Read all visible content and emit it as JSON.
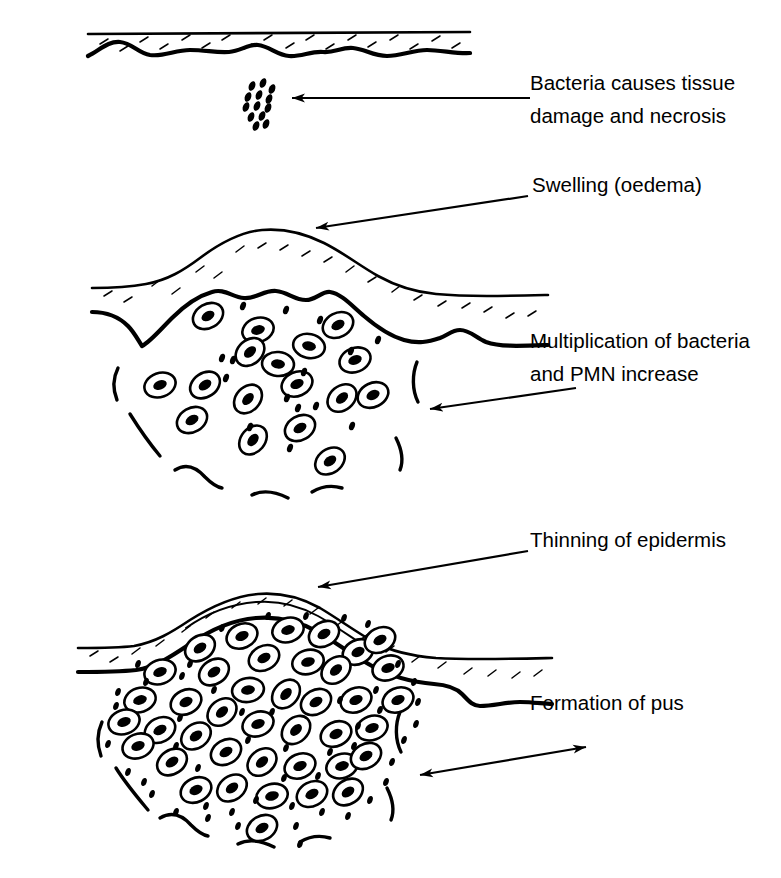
{
  "figure": {
    "background_color": "#ffffff",
    "ink_color": "#000000",
    "width": 781,
    "height": 878
  },
  "labels": [
    {
      "id": "bacteria-damage",
      "lines": [
        "Bacteria causes tissue",
        "damage and necrosis"
      ],
      "x": 530,
      "y": 90,
      "arrow": {
        "type": "single",
        "from_x": 530,
        "from_y": 98,
        "to_x": 286,
        "to_y": 98
      }
    },
    {
      "id": "swelling",
      "lines": [
        "Swelling (oedema)"
      ],
      "x": 532,
      "y": 192,
      "arrow": {
        "type": "single",
        "from_x": 528,
        "from_y": 196,
        "to_x": 310,
        "to_y": 229
      }
    },
    {
      "id": "multiplication",
      "lines": [
        "Multiplication of bacteria",
        "and PMN increase"
      ],
      "x": 530,
      "y": 348,
      "arrow": {
        "type": "single",
        "from_x": 575,
        "from_y": 389,
        "to_x": 424,
        "to_y": 410
      }
    },
    {
      "id": "thinning",
      "lines": [
        "Thinning of epidermis"
      ],
      "x": 530,
      "y": 547,
      "arrow": {
        "type": "single",
        "from_x": 528,
        "from_y": 551,
        "to_x": 312,
        "to_y": 588
      }
    },
    {
      "id": "formation-of-pus",
      "lines": [
        "Formation of pus"
      ],
      "x": 530,
      "y": 710,
      "arrow": {
        "type": "double",
        "from_x": 586,
        "from_y": 747,
        "to_x": 414,
        "to_y": 776
      }
    }
  ],
  "panels": [
    {
      "id": "panel-normal-skin",
      "stage": 1,
      "caption_ref": "bacteria-damage",
      "description": "Flat intact skin with epidermis band; a small cluster of bacteria below the dermis",
      "cell_count": 0,
      "bacteria_count": 13
    },
    {
      "id": "panel-early-abscess",
      "stage": 2,
      "caption_ref": [
        "swelling",
        "multiplication"
      ],
      "description": "Raised dome of epidermis over a loose collection of PMN cells and bacteria in the dermis",
      "cell_count": 17,
      "bacteria_count": 15
    },
    {
      "id": "panel-mature-abscess",
      "stage": 3,
      "caption_ref": [
        "thinning",
        "formation-of-pus"
      ],
      "description": "Epidermis thinned and stretched over a dense mass of PMN cells forming pus",
      "cell_count": 42,
      "bacteria_count": 70
    }
  ],
  "legend_keys": {
    "cell": "PMN (polymorphonuclear leucocyte)",
    "dot": "bacterium",
    "band": "epidermis",
    "wavy_line": "dermis boundary"
  },
  "geometry": {
    "panel1": {
      "epidermis_top": "M 88,34 L 470,31",
      "epidermis_bottom": "M 88,55 C 103,47 110,40 122,42 C 134,44 140,54 152,55 C 166,56 176,50 190,50 C 206,50 215,52 228,51 C 240,50 248,44 258,45 C 268,46 276,54 288,55 C 300,56 310,51 322,52 C 334,53 340,47 352,48 C 364,49 372,55 386,55 C 400,55 412,50 426,50 C 440,50 456,53 470,52",
      "hatches": [
        [
          100,
          42,
          108,
          38
        ],
        [
          120,
          50,
          128,
          45
        ],
        [
          140,
          40,
          148,
          36
        ],
        [
          160,
          47,
          168,
          43
        ],
        [
          182,
          38,
          190,
          34
        ],
        [
          202,
          46,
          210,
          42
        ],
        [
          222,
          38,
          230,
          34
        ],
        [
          244,
          48,
          252,
          44
        ],
        [
          264,
          38,
          272,
          34
        ],
        [
          286,
          47,
          294,
          43
        ],
        [
          306,
          38,
          314,
          34
        ],
        [
          326,
          48,
          334,
          44
        ],
        [
          348,
          38,
          356,
          34
        ],
        [
          368,
          46,
          376,
          42
        ],
        [
          390,
          38,
          398,
          34
        ],
        [
          410,
          48,
          418,
          44
        ],
        [
          432,
          39,
          440,
          35
        ],
        [
          452,
          47,
          460,
          43
        ]
      ],
      "bacteria": [
        [
          252,
          86
        ],
        [
          262,
          83
        ],
        [
          272,
          88
        ],
        [
          248,
          96
        ],
        [
          258,
          94
        ],
        [
          268,
          97
        ],
        [
          245,
          106
        ],
        [
          255,
          104
        ],
        [
          266,
          106
        ],
        [
          250,
          116
        ],
        [
          261,
          114
        ],
        [
          256,
          124
        ],
        [
          265,
          122
        ]
      ]
    },
    "panel2": {
      "cells": [
        [
          208,
          316,
          15,
          11,
          -30
        ],
        [
          256,
          331,
          16,
          12,
          -20
        ],
        [
          307,
          348,
          16,
          12,
          10
        ],
        [
          337,
          327,
          15,
          11,
          -25
        ],
        [
          357,
          363,
          16,
          12,
          -35
        ],
        [
          206,
          420,
          16,
          12,
          -15
        ],
        [
          244,
          351,
          16,
          12,
          -40
        ],
        [
          248,
          397,
          15,
          11,
          -30
        ],
        [
          268,
          370,
          15,
          11,
          -20
        ],
        [
          297,
          387,
          16,
          12,
          -45
        ],
        [
          300,
          438,
          15,
          11,
          -25
        ],
        [
          334,
          411,
          16,
          12,
          -15
        ],
        [
          345,
          372,
          15,
          11,
          -30
        ],
        [
          328,
          466,
          16,
          12,
          -35
        ],
        [
          372,
          394,
          15,
          11,
          -25
        ],
        [
          182,
          378,
          15,
          11,
          -20
        ],
        [
          155,
          393,
          15,
          11,
          -35
        ]
      ],
      "bacteria": [
        [
          243,
          306
        ],
        [
          266,
          323
        ],
        [
          303,
          371
        ],
        [
          352,
          339
        ],
        [
          223,
          360
        ],
        [
          228,
          372
        ],
        [
          230,
          388
        ],
        [
          287,
          397
        ],
        [
          321,
          353
        ],
        [
          312,
          415
        ],
        [
          290,
          425
        ],
        [
          248,
          427
        ],
        [
          336,
          435
        ],
        [
          352,
          426
        ],
        [
          273,
          455
        ]
      ]
    },
    "panel3": {
      "description": "Dense cluster of 42 PMN cells filling the abscess cavity, with 70 bacteria dots scattered around the periphery"
    }
  }
}
